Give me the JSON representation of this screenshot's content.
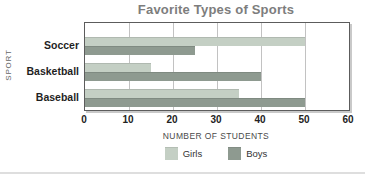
{
  "chart_data": {
    "type": "bar",
    "orientation": "horizontal",
    "title": "Favorite Types of Sports",
    "xlabel": "NUMBER OF STUDENTS",
    "ylabel": "SPORT",
    "categories": [
      "Soccer",
      "Basketball",
      "Baseball"
    ],
    "series": [
      {
        "name": "Girls",
        "color": "#c4cfc4",
        "values": [
          50,
          15,
          35
        ]
      },
      {
        "name": "Boys",
        "color": "#8e9a90",
        "values": [
          25,
          40,
          50
        ]
      }
    ],
    "xlim": [
      0,
      60
    ],
    "xticks": [
      0,
      10,
      20,
      30,
      40,
      50,
      60
    ],
    "grid": true,
    "legend_position": "bottom",
    "colors": {
      "gridline": "#c2c2c2",
      "plot_border": "#5c5c5c",
      "title_text": "#7d7d7d"
    }
  }
}
